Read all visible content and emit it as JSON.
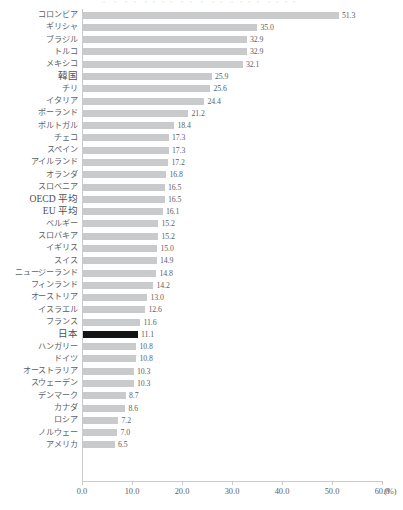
{
  "top_clipped_text": "・ ・  ・・  ・・・・  ・・  ・ ・・  ・・・・  ・・・・",
  "chart_data": {
    "type": "bar",
    "orientation": "horizontal",
    "title": "",
    "xlabel": "(%)",
    "ylabel": "",
    "xlim": [
      0,
      60
    ],
    "grid": false,
    "legend": null,
    "bar_color": "#c9cacb",
    "highlight_color": "#141414",
    "highlight_category": "日本",
    "axis_unit": "(%)",
    "tick_labels": [
      "0.0",
      "10.0",
      "20.0",
      "30.0",
      "40.0",
      "50.0",
      "60.0"
    ],
    "tick_values": [
      0,
      10,
      20,
      30,
      40,
      50,
      60
    ],
    "categories": [
      "コロンビア",
      "ギリシャ",
      "ブラジル",
      "トルコ",
      "メキシコ",
      "韓国",
      "チリ",
      "イタリア",
      "ポーランド",
      "ポルトガル",
      "チェコ",
      "スペイン",
      "アイルランド",
      "オランダ",
      "スロベニア",
      "OECD 平均",
      "EU 平均",
      "ベルギー",
      "スロバキア",
      "イギリス",
      "スイス",
      "ニュージーランド",
      "フィンランド",
      "オーストリア",
      "イスラエル",
      "フランス",
      "日本",
      "ハンガリー",
      "ドイツ",
      "オーストラリア",
      "スウェーデン",
      "デンマーク",
      "カナダ",
      "ロシア",
      "ノルウェー",
      "アメリカ"
    ],
    "values": [
      51.3,
      35.0,
      32.9,
      32.9,
      32.1,
      25.9,
      25.6,
      24.4,
      21.2,
      18.4,
      17.3,
      17.3,
      17.2,
      16.8,
      16.5,
      16.5,
      16.1,
      15.2,
      15.2,
      15.0,
      14.9,
      14.8,
      14.2,
      13.0,
      12.6,
      11.6,
      11.1,
      10.8,
      10.8,
      10.3,
      10.3,
      8.7,
      8.6,
      7.2,
      7.0,
      6.5
    ],
    "value_labels": [
      "51.3",
      "35.0",
      "32.9",
      "32.9",
      "32.1",
      "25.9",
      "25.6",
      "24.4",
      "21.2",
      "18.4",
      "17.3",
      "17.3",
      "17.2",
      "16.8",
      "16.5",
      "16.5",
      "16.1",
      "15.2",
      "15.2",
      "15.0",
      "14.9",
      "14.8",
      "14.2",
      "13.0",
      "12.6",
      "11.6",
      "11.1",
      "10.8",
      "10.8",
      "10.3",
      "10.3",
      "8.7",
      "8.6",
      "7.2",
      "7.0",
      "6.5"
    ],
    "emphasized_categories": [
      "韓国",
      "OECD 平均",
      "EU 平均",
      "日本"
    ]
  }
}
